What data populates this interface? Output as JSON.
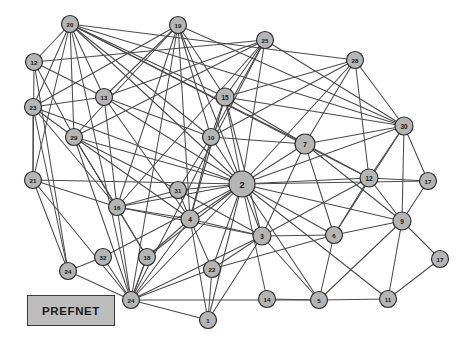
{
  "figure": {
    "type": "network-graph",
    "background_color": "#ffffff",
    "width": 466,
    "height": 354
  },
  "legend": {
    "label": "PREFNET",
    "box_fill": "#bdbdbd",
    "box_border": "#3a3a3a"
  },
  "style": {
    "node_fill": "#b5b5b5",
    "node_stroke": "#2e2e2e",
    "edge_color": "#4a4a4a",
    "label_color": "#151515"
  },
  "chart_data": {
    "type": "network",
    "title": "PREFNET",
    "node_count": 32,
    "edge_count": 96,
    "nodes": [
      {
        "id": "20",
        "label": "20",
        "x": 70,
        "y": 24,
        "r": 8.5
      },
      {
        "id": "19",
        "label": "19",
        "x": 178,
        "y": 25,
        "r": 8.5
      },
      {
        "id": "25",
        "label": "25",
        "x": 265,
        "y": 40,
        "r": 8.5
      },
      {
        "id": "28",
        "label": "28",
        "x": 355,
        "y": 60,
        "r": 8.5
      },
      {
        "id": "12",
        "label": "12",
        "x": 34,
        "y": 62,
        "r": 8.5
      },
      {
        "id": "13",
        "label": "13",
        "x": 104,
        "y": 97,
        "r": 8.5
      },
      {
        "id": "15",
        "label": "15",
        "x": 225,
        "y": 97,
        "r": 9.0
      },
      {
        "id": "23",
        "label": "23",
        "x": 33,
        "y": 107,
        "r": 8.5
      },
      {
        "id": "30",
        "label": "30",
        "x": 404,
        "y": 126,
        "r": 9.0
      },
      {
        "id": "10",
        "label": "10",
        "x": 211,
        "y": 137,
        "r": 8.5
      },
      {
        "id": "29",
        "label": "29",
        "x": 74,
        "y": 137,
        "r": 8.5
      },
      {
        "id": "7",
        "label": "7",
        "x": 305,
        "y": 144,
        "r": 10.0
      },
      {
        "id": "2",
        "label": "2",
        "x": 242,
        "y": 184,
        "r": 13.0
      },
      {
        "id": "12b",
        "label": "12",
        "x": 369,
        "y": 178,
        "r": 9.0
      },
      {
        "id": "17",
        "label": "17",
        "x": 428,
        "y": 181,
        "r": 8.5
      },
      {
        "id": "21",
        "label": "21",
        "x": 33,
        "y": 180,
        "r": 8.5
      },
      {
        "id": "31",
        "label": "31",
        "x": 178,
        "y": 190,
        "r": 8.5
      },
      {
        "id": "16",
        "label": "16",
        "x": 117,
        "y": 207,
        "r": 8.5
      },
      {
        "id": "4",
        "label": "4",
        "x": 190,
        "y": 219,
        "r": 9.0
      },
      {
        "id": "9",
        "label": "9",
        "x": 402,
        "y": 221,
        "r": 9.0
      },
      {
        "id": "6",
        "label": "6",
        "x": 334,
        "y": 235,
        "r": 8.5
      },
      {
        "id": "3",
        "label": "3",
        "x": 262,
        "y": 236,
        "r": 9.0
      },
      {
        "id": "18",
        "label": "18",
        "x": 147,
        "y": 257,
        "r": 8.5
      },
      {
        "id": "32",
        "label": "32",
        "x": 103,
        "y": 257,
        "r": 8.5
      },
      {
        "id": "22",
        "label": "22",
        "x": 212,
        "y": 269,
        "r": 8.5
      },
      {
        "id": "24",
        "label": "24",
        "x": 68,
        "y": 271,
        "r": 8.5
      },
      {
        "id": "17b",
        "label": "17",
        "x": 440,
        "y": 259,
        "r": 8.5
      },
      {
        "id": "24b",
        "label": "24",
        "x": 131,
        "y": 300,
        "r": 8.5
      },
      {
        "id": "1",
        "label": "1",
        "x": 208,
        "y": 320,
        "r": 8.5
      },
      {
        "id": "14",
        "label": "14",
        "x": 267,
        "y": 299,
        "r": 8.5
      },
      {
        "id": "5",
        "label": "5",
        "x": 319,
        "y": 300,
        "r": 8.5
      },
      {
        "id": "11",
        "label": "11",
        "x": 388,
        "y": 299,
        "r": 8.5
      }
    ],
    "edges": [
      [
        "20",
        "12"
      ],
      [
        "20",
        "23"
      ],
      [
        "20",
        "29"
      ],
      [
        "20",
        "13"
      ],
      [
        "20",
        "21"
      ],
      [
        "20",
        "10"
      ],
      [
        "20",
        "15"
      ],
      [
        "20",
        "30"
      ],
      [
        "20",
        "28"
      ],
      [
        "20",
        "12b"
      ],
      [
        "20",
        "2"
      ],
      [
        "20",
        "7"
      ],
      [
        "20",
        "24b"
      ],
      [
        "19",
        "13"
      ],
      [
        "19",
        "29"
      ],
      [
        "19",
        "23"
      ],
      [
        "19",
        "15"
      ],
      [
        "19",
        "10"
      ],
      [
        "19",
        "2"
      ],
      [
        "19",
        "4"
      ],
      [
        "19",
        "30"
      ],
      [
        "19",
        "16"
      ],
      [
        "19",
        "24b"
      ],
      [
        "25",
        "13"
      ],
      [
        "25",
        "29"
      ],
      [
        "25",
        "15"
      ],
      [
        "25",
        "2"
      ],
      [
        "25",
        "10"
      ],
      [
        "25",
        "30"
      ],
      [
        "25",
        "16"
      ],
      [
        "25",
        "24b"
      ],
      [
        "25",
        "12"
      ],
      [
        "28",
        "15"
      ],
      [
        "28",
        "30"
      ],
      [
        "28",
        "2"
      ],
      [
        "28",
        "10"
      ],
      [
        "28",
        "7"
      ],
      [
        "28",
        "12b"
      ],
      [
        "12",
        "29"
      ],
      [
        "12",
        "21"
      ],
      [
        "12",
        "13"
      ],
      [
        "12",
        "24"
      ],
      [
        "23",
        "29"
      ],
      [
        "23",
        "21"
      ],
      [
        "23",
        "16"
      ],
      [
        "23",
        "13"
      ],
      [
        "23",
        "24"
      ],
      [
        "23",
        "2"
      ],
      [
        "13",
        "10"
      ],
      [
        "13",
        "2"
      ],
      [
        "13",
        "16"
      ],
      [
        "13",
        "4"
      ],
      [
        "15",
        "2"
      ],
      [
        "15",
        "10"
      ],
      [
        "15",
        "7"
      ],
      [
        "15",
        "30"
      ],
      [
        "15",
        "4"
      ],
      [
        "15",
        "3"
      ],
      [
        "21",
        "24"
      ],
      [
        "21",
        "16"
      ],
      [
        "21",
        "24b"
      ],
      [
        "21",
        "2"
      ],
      [
        "29",
        "16"
      ],
      [
        "29",
        "2"
      ],
      [
        "29",
        "4"
      ],
      [
        "29",
        "31"
      ],
      [
        "29",
        "24b"
      ],
      [
        "29",
        "18"
      ],
      [
        "10",
        "2"
      ],
      [
        "10",
        "4"
      ],
      [
        "10",
        "31"
      ],
      [
        "10",
        "7"
      ],
      [
        "30",
        "7"
      ],
      [
        "30",
        "12b"
      ],
      [
        "30",
        "9"
      ],
      [
        "30",
        "2"
      ],
      [
        "30",
        "17"
      ],
      [
        "30",
        "6"
      ],
      [
        "7",
        "2"
      ],
      [
        "7",
        "12b"
      ],
      [
        "7",
        "3"
      ],
      [
        "7",
        "6"
      ],
      [
        "7",
        "9"
      ],
      [
        "2",
        "31"
      ],
      [
        "2",
        "4"
      ],
      [
        "2",
        "3"
      ],
      [
        "2",
        "6"
      ],
      [
        "2",
        "16"
      ],
      [
        "2",
        "18"
      ],
      [
        "2",
        "22"
      ],
      [
        "2",
        "24b"
      ],
      [
        "2",
        "1"
      ],
      [
        "2",
        "5"
      ],
      [
        "2",
        "9"
      ],
      [
        "2",
        "12b"
      ],
      [
        "2",
        "14"
      ],
      [
        "2",
        "17"
      ],
      [
        "2",
        "11"
      ],
      [
        "2",
        "32"
      ],
      [
        "12b",
        "9"
      ],
      [
        "12b",
        "17"
      ],
      [
        "12b",
        "6"
      ],
      [
        "12b",
        "3"
      ],
      [
        "17",
        "9"
      ],
      [
        "17b",
        "9"
      ],
      [
        "17b",
        "11"
      ],
      [
        "31",
        "4"
      ],
      [
        "31",
        "16"
      ],
      [
        "31",
        "3"
      ],
      [
        "16",
        "4"
      ],
      [
        "16",
        "18"
      ],
      [
        "16",
        "24b"
      ],
      [
        "16",
        "3"
      ],
      [
        "4",
        "3"
      ],
      [
        "4",
        "22"
      ],
      [
        "4",
        "24b"
      ],
      [
        "4",
        "18"
      ],
      [
        "4",
        "1"
      ],
      [
        "9",
        "6"
      ],
      [
        "9",
        "5"
      ],
      [
        "9",
        "11"
      ],
      [
        "9",
        "17b"
      ],
      [
        "6",
        "3"
      ],
      [
        "6",
        "5"
      ],
      [
        "6",
        "22"
      ],
      [
        "3",
        "22"
      ],
      [
        "3",
        "1"
      ],
      [
        "3",
        "24b"
      ],
      [
        "3",
        "5"
      ],
      [
        "18",
        "24b"
      ],
      [
        "32",
        "24"
      ],
      [
        "32",
        "24b"
      ],
      [
        "22",
        "1"
      ],
      [
        "22",
        "24b"
      ],
      [
        "24b",
        "1"
      ],
      [
        "24b",
        "5"
      ],
      [
        "24b",
        "18"
      ],
      [
        "5",
        "11"
      ],
      [
        "5",
        "14"
      ],
      [
        "24",
        "24b"
      ]
    ]
  }
}
